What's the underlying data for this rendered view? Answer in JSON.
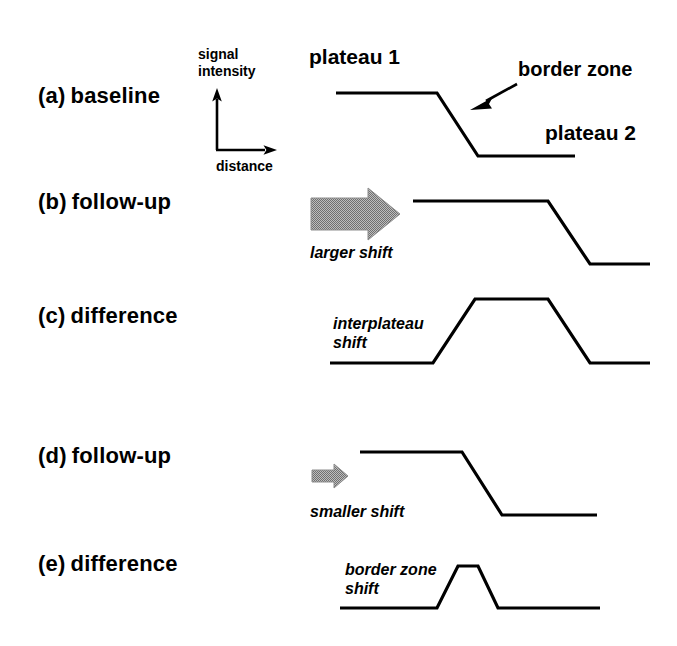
{
  "figure": {
    "background_color": "#ffffff",
    "line_color": "#000000",
    "arrow_fill_color": "#9a9a9a"
  },
  "axis": {
    "y_label_line1": "signal",
    "y_label_line2": "intensity",
    "x_label": "distance"
  },
  "annotations": {
    "plateau1": "plateau 1",
    "plateau2": "plateau 2",
    "border_zone": "border zone"
  },
  "rows": [
    {
      "key": "a",
      "paren": "(a)",
      "label": "baseline",
      "shift_label_line1": "",
      "shift_label_line2": ""
    },
    {
      "key": "b",
      "paren": "(b)",
      "label": "follow-up",
      "shift_label_line1": "larger shift",
      "shift_label_line2": ""
    },
    {
      "key": "c",
      "paren": "(c)",
      "label": "difference",
      "shift_label_line1": "interplateau",
      "shift_label_line2": "shift"
    },
    {
      "key": "d",
      "paren": "(d)",
      "label": "follow-up",
      "shift_label_line1": "smaller shift",
      "shift_label_line2": ""
    },
    {
      "key": "e",
      "paren": "(e)",
      "label": "difference",
      "shift_label_line1": "border zone",
      "shift_label_line2": "shift"
    }
  ],
  "chart_data": {
    "type": "line",
    "xlabel": "distance",
    "ylabel": "signal intensity",
    "grid": false,
    "legend": "none",
    "note": "Five stacked schematic profiles; coordinates are figure pixel positions (y increases downward).",
    "series": [
      {
        "name": "(a) baseline",
        "points": [
          [
            336,
            93
          ],
          [
            437,
            93
          ],
          [
            478,
            156
          ],
          [
            575,
            156
          ]
        ]
      },
      {
        "name": "(b) follow-up",
        "points": [
          [
            413,
            201
          ],
          [
            548,
            201
          ],
          [
            590,
            264
          ],
          [
            650,
            264
          ]
        ]
      },
      {
        "name": "(c) difference",
        "points": [
          [
            330,
            363
          ],
          [
            433,
            363
          ],
          [
            475,
            299
          ],
          [
            548,
            299
          ],
          [
            590,
            363
          ],
          [
            650,
            363
          ]
        ]
      },
      {
        "name": "(d) follow-up",
        "points": [
          [
            360,
            452
          ],
          [
            462,
            452
          ],
          [
            502,
            515
          ],
          [
            597,
            515
          ]
        ]
      },
      {
        "name": "(e) difference",
        "points": [
          [
            340,
            608
          ],
          [
            437,
            608
          ],
          [
            458,
            566
          ],
          [
            478,
            566
          ],
          [
            498,
            608
          ],
          [
            600,
            608
          ]
        ]
      }
    ]
  }
}
